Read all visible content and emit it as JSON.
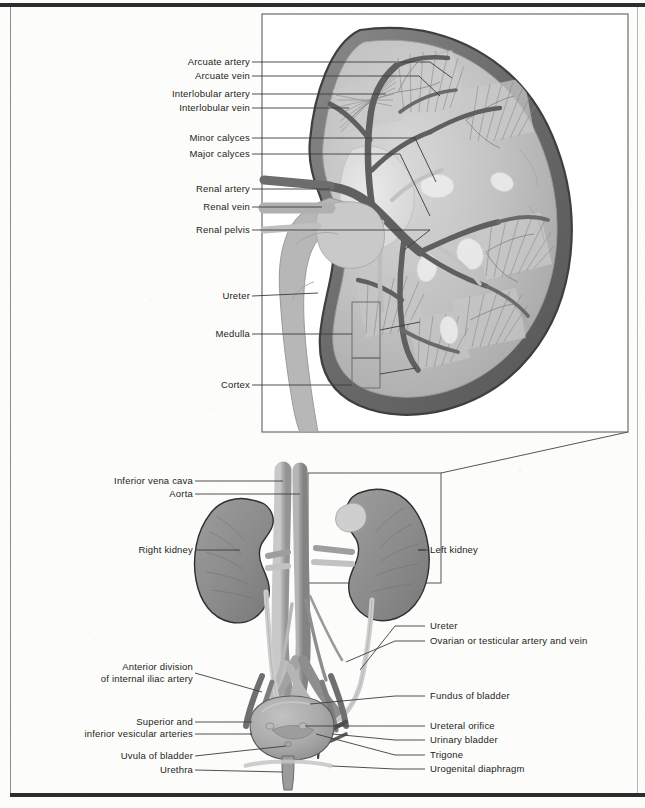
{
  "figure": {
    "panels": [
      "magnified-kidney-section",
      "urinary-system-overview"
    ]
  },
  "colors": {
    "capsule_dark": "#6e6e6e",
    "capsule_outline": "#4a4a4a",
    "parenchyma": "#b9b9b9",
    "parenchyma_light": "#d2d2d2",
    "artery": "#8a8a8a",
    "vein": "#b4b4b4",
    "vessel_dark": "#5c5c5c",
    "leader": "#3c3c3c",
    "text": "#231f20",
    "frame": "#2b2b2b"
  },
  "top_panel": {
    "name": "magnified kidney coronal section",
    "labels": [
      {
        "id": "arcuate-artery",
        "text": "Arcuate artery",
        "x": 248,
        "y": 58,
        "line_to": 430,
        "kind": "line"
      },
      {
        "id": "arcuate-vein",
        "text": "Arcuate vein",
        "x": 248,
        "y": 72,
        "line_to": 419,
        "kind": "line"
      },
      {
        "id": "interlobular-artery",
        "text": "Interlobular artery",
        "x": 248,
        "y": 90,
        "line_to": 386,
        "kind": "line"
      },
      {
        "id": "interlobular-vein",
        "text": "Interlobular vein",
        "x": 248,
        "y": 104,
        "line_to": 349,
        "kind": "line"
      },
      {
        "id": "minor-calyces",
        "text": "Minor calyces",
        "x": 248,
        "y": 134,
        "line_to": 415,
        "kind": "line"
      },
      {
        "id": "major-calyces",
        "text": "Major calyces",
        "x": 248,
        "y": 150,
        "line_to": 400,
        "kind": "line"
      },
      {
        "id": "renal-artery",
        "text": "Renal artery",
        "x": 248,
        "y": 185,
        "line_to": 330,
        "kind": "line"
      },
      {
        "id": "renal-vein",
        "text": "Renal vein",
        "x": 248,
        "y": 203,
        "line_to": 320,
        "kind": "line"
      },
      {
        "id": "renal-pelvis",
        "text": "Renal pelvis",
        "x": 248,
        "y": 226,
        "line_to": 430,
        "kind": "line"
      },
      {
        "id": "ureter",
        "text": "Ureter",
        "x": 248,
        "y": 292,
        "line_to": 318,
        "kind": "line"
      },
      {
        "id": "medulla",
        "text": "Medulla",
        "x": 248,
        "y": 330,
        "line_to": 352,
        "kind": "bracket"
      },
      {
        "id": "cortex",
        "text": "Cortex",
        "x": 248,
        "y": 381,
        "line_to": 352,
        "kind": "bracket"
      }
    ]
  },
  "bottom_panel": {
    "name": "urinary system overview",
    "labels_left": [
      {
        "id": "inferior-vena-cava",
        "text": "Inferior vena cava",
        "x": 220,
        "y": 477
      },
      {
        "id": "aorta",
        "text": "Aorta",
        "x": 220,
        "y": 490
      },
      {
        "id": "right-kidney",
        "text": "Right kidney",
        "x": 220,
        "y": 546
      },
      {
        "id": "anterior-division-internal-iliac-artery",
        "text": "Anterior division\nof internal iliac artery",
        "x": 224,
        "y": 665
      },
      {
        "id": "superior-inferior-vesicular-arteries",
        "text": "Superior and\ninferior vesicular arteries",
        "x": 224,
        "y": 720
      },
      {
        "id": "uvula-of-bladder",
        "text": "Uvula of bladder",
        "x": 224,
        "y": 752
      },
      {
        "id": "urethra",
        "text": "Urethra",
        "x": 224,
        "y": 766
      }
    ],
    "labels_right": [
      {
        "id": "left-kidney",
        "text": "Left kidney",
        "x": 430,
        "y": 546
      },
      {
        "id": "ureter-lower",
        "text": "Ureter",
        "x": 430,
        "y": 622
      },
      {
        "id": "ovarian-testicular-vessels",
        "text": "Ovarian or testicular artery and vein",
        "x": 430,
        "y": 637
      },
      {
        "id": "fundus-of-bladder",
        "text": "Fundus of bladder",
        "x": 430,
        "y": 692
      },
      {
        "id": "ureteral-orifice",
        "text": "Ureteral orifice",
        "x": 430,
        "y": 722
      },
      {
        "id": "urinary-bladder",
        "text": "Urinary bladder",
        "x": 430,
        "y": 736
      },
      {
        "id": "trigone",
        "text": "Trigone",
        "x": 430,
        "y": 751
      },
      {
        "id": "urogenital-diaphragm",
        "text": "Urogenital diaphragm",
        "x": 430,
        "y": 765
      }
    ]
  }
}
